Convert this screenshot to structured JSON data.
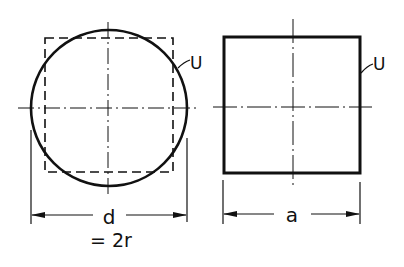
{
  "figure": {
    "type": "technical drawing",
    "colors": {
      "line": "#111111",
      "background": "#ffffff"
    },
    "left_view": {
      "shape": "circle",
      "perimeter_label": "U",
      "dimension_label": "d",
      "dimension_note": "= 2r",
      "inscribed_outline": "dashed square"
    },
    "right_view": {
      "shape": "square",
      "perimeter_label": "U",
      "dimension_label": "a"
    }
  }
}
